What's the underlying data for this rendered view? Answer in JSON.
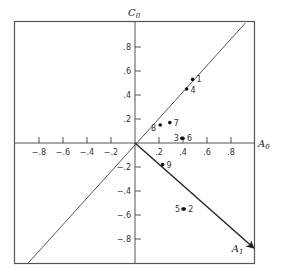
{
  "chart_data": {
    "type": "scatter",
    "title": "",
    "xlabel": "A0",
    "ylabel": "C0",
    "xlabel_display": {
      "main": "A",
      "sub": "0"
    },
    "ylabel_display": {
      "main": "C",
      "sub": "0"
    },
    "xlim": [
      -1.0,
      1.0
    ],
    "ylim": [
      -1.0,
      1.0
    ],
    "grid": false,
    "x_ticks": [
      -0.8,
      -0.6,
      -0.4,
      -0.2,
      0.2,
      0.4,
      0.6,
      0.8
    ],
    "x_tick_labels": [
      "−.8",
      "−.6",
      "−.4",
      "−.2",
      ".2",
      ".4",
      ".6",
      ".8"
    ],
    "y_ticks": [
      0.8,
      0.6,
      0.4,
      0.2,
      -0.2,
      -0.4,
      -0.6,
      -0.8
    ],
    "y_tick_labels": [
      ".8",
      ".6",
      ".4",
      ".2",
      "−.2",
      "−.4",
      "−.6",
      "−.8"
    ],
    "points": [
      {
        "label": "1",
        "x": 0.48,
        "y": 0.53
      },
      {
        "label": "2",
        "x": 0.41,
        "y": -0.55
      },
      {
        "label": "3",
        "x": 0.39,
        "y": 0.04
      },
      {
        "label": "4",
        "x": 0.43,
        "y": 0.45
      },
      {
        "label": "5",
        "x": 0.4,
        "y": -0.55
      },
      {
        "label": "6",
        "x": 0.4,
        "y": 0.04
      },
      {
        "label": "7",
        "x": 0.29,
        "y": 0.17
      },
      {
        "label": "8",
        "x": 0.21,
        "y": 0.15
      },
      {
        "label": "9",
        "x": 0.23,
        "y": -0.18
      }
    ],
    "lines": [
      {
        "name": "diagonal-line",
        "from": [
          -0.89,
          -1.0
        ],
        "to": [
          0.92,
          1.0
        ],
        "arrow": false
      },
      {
        "name": "A1-vector",
        "from": [
          0.0,
          0.0
        ],
        "to": [
          0.99,
          -0.875
        ],
        "arrow": true,
        "label": "A1",
        "label_display": {
          "main": "A",
          "sub": "1"
        }
      }
    ]
  }
}
